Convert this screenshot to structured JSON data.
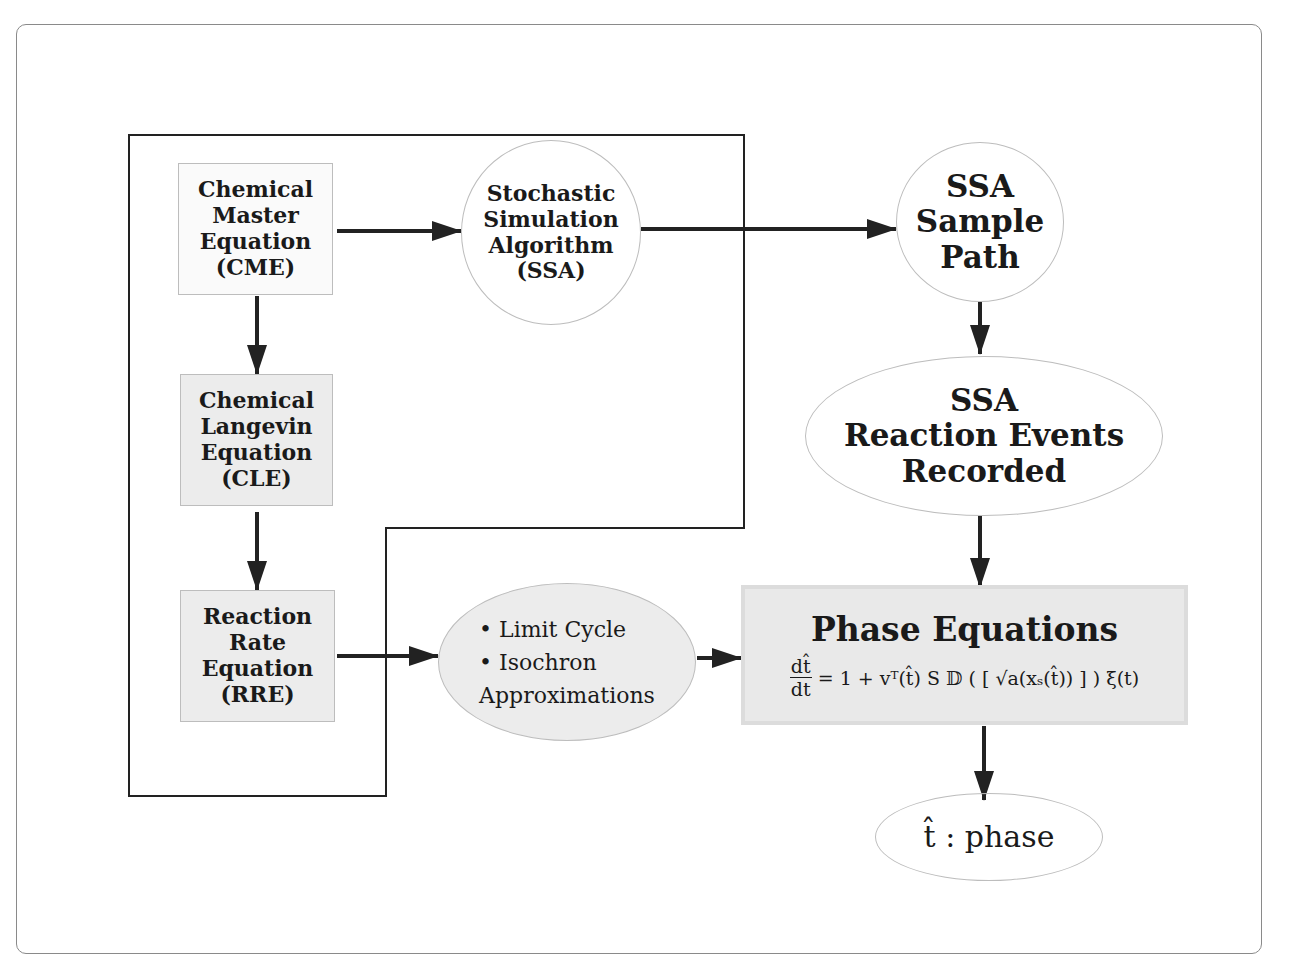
{
  "diagram": {
    "nodes": {
      "cme": {
        "lines": [
          "Chemical",
          "Master",
          "Equation",
          "(CME)"
        ]
      },
      "cle": {
        "lines": [
          "Chemical",
          "Langevin",
          "Equation",
          "(CLE)"
        ]
      },
      "rre": {
        "lines": [
          "Reaction",
          "Rate",
          "Equation",
          "(RRE)"
        ]
      },
      "ssa_algorithm": {
        "lines": [
          "Stochastic",
          "Simulation",
          "Algorithm",
          "(SSA)"
        ]
      },
      "ssa_sample_path": {
        "lines": [
          "SSA",
          "Sample",
          "Path"
        ]
      },
      "ssa_events": {
        "lines": [
          "SSA",
          "Reaction Events",
          "Recorded"
        ]
      },
      "approximations": {
        "lines": [
          "• Limit Cycle",
          "• Isochron",
          "Approximations"
        ]
      },
      "phase_equations": {
        "title": "Phase Equations",
        "eq_numerator": "dt̂",
        "eq_denominator": "dt",
        "eq_rhs": "= 1 + vᵀ(t̂) S 𝔻 ( [ √a(xₛ(t̂)) ] ) ξ(t)"
      },
      "phase_output": {
        "label": "t̂ : phase"
      }
    },
    "edges": [
      {
        "from": "cme",
        "to": "ssa_algorithm"
      },
      {
        "from": "ssa_algorithm",
        "to": "ssa_sample_path"
      },
      {
        "from": "cme",
        "to": "cle"
      },
      {
        "from": "cle",
        "to": "rre"
      },
      {
        "from": "rre",
        "to": "approximations"
      },
      {
        "from": "approximations",
        "to": "phase_equations"
      },
      {
        "from": "ssa_sample_path",
        "to": "ssa_events"
      },
      {
        "from": "ssa_events",
        "to": "phase_equations"
      },
      {
        "from": "phase_equations",
        "to": "phase_output"
      }
    ]
  }
}
